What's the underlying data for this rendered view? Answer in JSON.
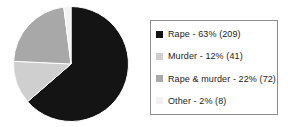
{
  "chart_data": {
    "type": "pie",
    "title": "",
    "subtitle": "",
    "xlabel": "",
    "ylabel": "",
    "grid": false,
    "legend_position": "right",
    "start_angle_deg": 0,
    "direction": "clockwise",
    "categories": [
      "Rape",
      "Murder",
      "Rape & murder",
      "Other"
    ],
    "values": [
      63,
      12,
      22,
      2
    ],
    "counts": [
      209,
      41,
      72,
      8
    ],
    "value_unit": "%",
    "total_count": 330,
    "colors": [
      "#141414",
      "#cfcfcf",
      "#a8a8a8",
      "#f2f2f2"
    ],
    "slices": [
      {
        "label": "Rape",
        "percent": 63,
        "count": 209,
        "color": "#141414",
        "legend_text": "Rape - 63% (209)"
      },
      {
        "label": "Murder",
        "percent": 12,
        "count": 41,
        "color": "#cfcfcf",
        "legend_text": "Murder - 12% (41)"
      },
      {
        "label": "Rape & murder",
        "percent": 22,
        "count": 72,
        "color": "#a8a8a8",
        "legend_text": "Rape & murder - 22% (72)"
      },
      {
        "label": "Other",
        "percent": 2,
        "count": 8,
        "color": "#f2f2f2",
        "legend_text": "Other - 2% (8)"
      }
    ]
  },
  "legend": {
    "items": [
      {
        "swatch_name": "legend-swatch-rape",
        "text": "Rape - 63% (209)"
      },
      {
        "swatch_name": "legend-swatch-murder",
        "text": "Murder - 12% (41)"
      },
      {
        "swatch_name": "legend-swatch-rape-and-murder",
        "text": "Rape & murder - 22% (72)"
      },
      {
        "swatch_name": "legend-swatch-other",
        "text": "Other - 2% (8)"
      }
    ]
  },
  "style": {
    "background": "#ffffff",
    "legend_border": "#8d8d8d",
    "text_color": "#1b1b1b",
    "slice_separator": "#ffffff"
  }
}
